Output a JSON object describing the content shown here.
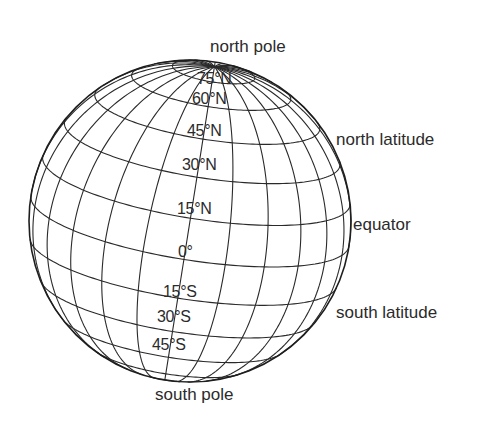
{
  "diagram": {
    "type": "globe-latitude-grid",
    "globe": {
      "center": [
        190,
        221
      ],
      "radius": 161,
      "elevation_deg": 14,
      "axis_roll_deg": -9,
      "meridian_step_deg": 15,
      "latitude_lines_deg": [
        75,
        60,
        45,
        30,
        15,
        0,
        -15,
        -30,
        -45,
        -60,
        -75
      ],
      "line_color": "#2a2a2a",
      "outline_color": "#1e1e1e"
    },
    "callouts": [
      {
        "id": "north-pole",
        "text": "north pole",
        "x": 210,
        "y": 38
      },
      {
        "id": "north-latitude",
        "text": "north latitude",
        "x": 336,
        "y": 131
      },
      {
        "id": "equator",
        "text": "equator",
        "x": 353,
        "y": 216
      },
      {
        "id": "south-latitude",
        "text": "south latitude",
        "x": 336,
        "y": 304
      },
      {
        "id": "south-pole",
        "text": "south pole",
        "x": 155,
        "y": 386
      }
    ],
    "latitude_labels": [
      {
        "id": "lat-75n",
        "text": "75°N",
        "x": 197,
        "y": 71
      },
      {
        "id": "lat-60n",
        "text": "60°N",
        "x": 192,
        "y": 91
      },
      {
        "id": "lat-45n",
        "text": "45°N",
        "x": 187,
        "y": 123
      },
      {
        "id": "lat-30n",
        "text": "30°N",
        "x": 182,
        "y": 157
      },
      {
        "id": "lat-15n",
        "text": "15°N",
        "x": 177,
        "y": 201
      },
      {
        "id": "lat-0",
        "text": "0°",
        "x": 178,
        "y": 244
      },
      {
        "id": "lat-15s",
        "text": "15°S",
        "x": 163,
        "y": 284
      },
      {
        "id": "lat-30s",
        "text": "30°S",
        "x": 157,
        "y": 309
      },
      {
        "id": "lat-45s",
        "text": "45°S",
        "x": 152,
        "y": 337
      }
    ]
  }
}
